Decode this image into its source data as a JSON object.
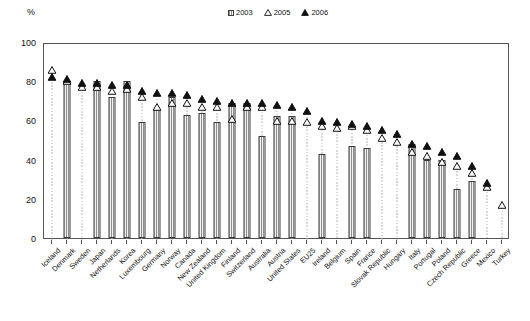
{
  "axis": {
    "y_unit": "%",
    "y_ticks": [
      0,
      20,
      40,
      60,
      80,
      100
    ],
    "y_min": 0,
    "y_max": 100
  },
  "legend": {
    "items": [
      {
        "label": "2003",
        "marker": "hatched-square-swatch"
      },
      {
        "label": "2005",
        "marker": "open-triangle-marker"
      },
      {
        "label": "2006",
        "marker": "filled-triangle-marker"
      }
    ]
  },
  "chart_data": {
    "type": "bar",
    "title": "",
    "subtitle": "",
    "xlabel": "",
    "ylabel": "%",
    "ylim": [
      0,
      100
    ],
    "grid": false,
    "legend_position": "top-center",
    "categories": [
      "Iceland",
      "Denmark",
      "Sweden",
      "Japan",
      "Netherlands",
      "Korea",
      "Luxembourg",
      "Germany",
      "Norway",
      "Canada",
      "New Zealand",
      "United Kingdom",
      "Finland",
      "Switzerland",
      "Australia",
      "Austria",
      "United States",
      "EU25",
      "Ireland",
      "Belgium",
      "Spain",
      "France",
      "Slovak Republic",
      "Hungary",
      "Italy",
      "Portugal",
      "Poland",
      "Czech Republic",
      "Greece",
      "Mexico",
      "Turkey"
    ],
    "series": [
      {
        "name": "2003",
        "marker": "bar",
        "values": [
          null,
          79,
          null,
          80,
          72,
          80,
          59,
          66,
          72,
          63,
          64,
          59,
          69,
          69,
          52,
          62,
          62,
          null,
          43,
          null,
          47,
          46,
          null,
          null,
          48,
          40,
          40,
          25,
          29,
          null,
          null
        ]
      },
      {
        "name": "2005",
        "marker": "open-triangle",
        "values": [
          89,
          83,
          80,
          80,
          78,
          79,
          75,
          70,
          72,
          72,
          70,
          70,
          64,
          70,
          70,
          63,
          63,
          62,
          60,
          59,
          60,
          58,
          54,
          52,
          47,
          45,
          42,
          40,
          36,
          29,
          20
        ]
      },
      {
        "name": "2006",
        "marker": "filled-triangle",
        "values": [
          85,
          84,
          82,
          82,
          81,
          81,
          78,
          77,
          77,
          76,
          74,
          73,
          72,
          72,
          72,
          71,
          70,
          68,
          63,
          62,
          61,
          60,
          58,
          56,
          51,
          50,
          47,
          45,
          40,
          31,
          null
        ]
      }
    ]
  }
}
